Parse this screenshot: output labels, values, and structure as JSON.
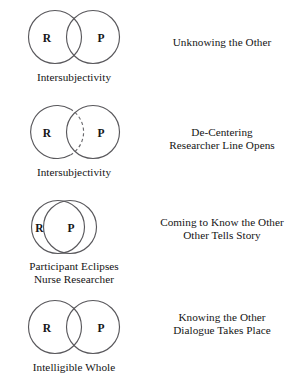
{
  "figure": {
    "background_color": "#ffffff",
    "stroke_color": "#59585c",
    "text_color": "#141414",
    "circle_labels": {
      "researcher": "R",
      "participant": "P"
    },
    "stages": [
      {
        "id": "unknowing",
        "researcher_label": "R",
        "participant_label": "P",
        "caption_lines": [
          "Intersubjectivity"
        ],
        "description_lines": [
          "Unknowing the Other"
        ],
        "overlap": "partial",
        "dashed_arc": false
      },
      {
        "id": "de-centering",
        "researcher_label": "R",
        "participant_label": "P",
        "caption_lines": [
          "Intersubjectivity"
        ],
        "description_lines": [
          "De-Centering",
          "Researcher Line Opens"
        ],
        "overlap": "partial",
        "dashed_arc": true
      },
      {
        "id": "coming-to-know",
        "researcher_label": "R",
        "participant_label": "P",
        "caption_lines": [
          "Participant Eclipses",
          "Nurse Researcher"
        ],
        "description_lines": [
          "Coming to Know the Other",
          "Other Tells Story"
        ],
        "overlap": "eclipsing",
        "dashed_arc": false
      },
      {
        "id": "knowing",
        "researcher_label": "R",
        "participant_label": "P",
        "caption_lines": [
          "Intelligible Whole"
        ],
        "description_lines": [
          "Knowing the Other",
          "Dialogue Takes Place"
        ],
        "overlap": "partial",
        "dashed_arc": false
      }
    ]
  }
}
